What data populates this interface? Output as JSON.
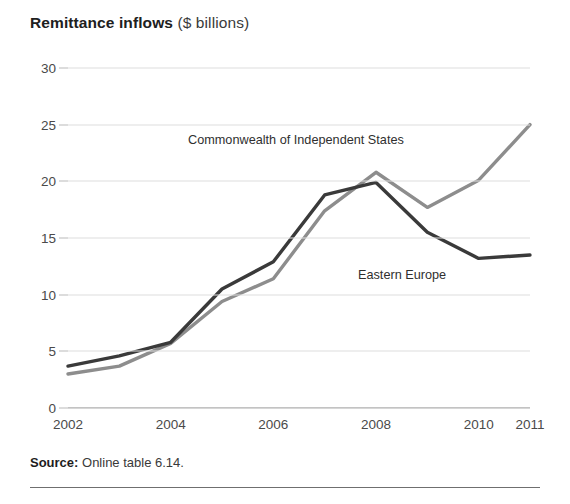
{
  "title": {
    "main": "Remittance inflows",
    "sub": " ($ billions)"
  },
  "source": {
    "label": "Source:",
    "text": " Online table 6.14."
  },
  "annotations": {
    "cis": "Commonwealth of Independent States",
    "eastern_europe": "Eastern Europe"
  },
  "colors": {
    "eastern_europe": "#3a3a3a",
    "cis": "#8d8d8d",
    "gridline": "#dedede",
    "axis": "#9a9a9a",
    "text": "#4a4a4a"
  },
  "chart_data": {
    "type": "line",
    "title": "Remittance inflows ($ billions)",
    "xlabel": "",
    "ylabel": "$ billions",
    "x": [
      2002,
      2003,
      2004,
      2005,
      2006,
      2007,
      2008,
      2009,
      2010,
      2011
    ],
    "xtick_labels": [
      "2002",
      "2004",
      "2006",
      "2008",
      "2010",
      "2011"
    ],
    "xticks": [
      2002,
      2004,
      2006,
      2008,
      2010,
      2011
    ],
    "ytick_labels": [
      "0",
      "5",
      "10",
      "15",
      "20",
      "25",
      "30"
    ],
    "yticks": [
      0,
      5,
      10,
      15,
      20,
      25,
      30
    ],
    "ylim": [
      0,
      30
    ],
    "xlim": [
      2002,
      2011
    ],
    "grid": true,
    "legend": "inline-annotations",
    "series": [
      {
        "name": "Eastern Europe",
        "color": "#3a3a3a",
        "values": [
          3.7,
          4.6,
          5.8,
          10.5,
          12.9,
          18.8,
          19.9,
          15.5,
          13.2,
          13.5
        ]
      },
      {
        "name": "Commonwealth of Independent States",
        "color": "#8d8d8d",
        "values": [
          3.0,
          3.7,
          5.7,
          9.4,
          11.4,
          17.4,
          20.8,
          17.7,
          20.1,
          25.0
        ]
      }
    ]
  }
}
